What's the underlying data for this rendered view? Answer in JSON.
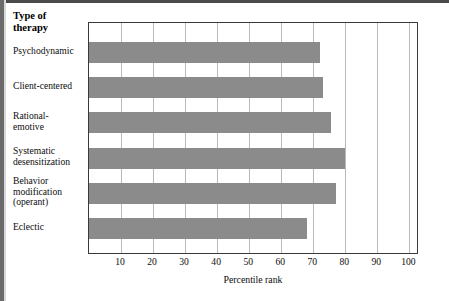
{
  "figure": {
    "category_header": "Type of\ntherapy",
    "category_header_line1": "Type of",
    "category_header_line2": "therapy",
    "bar_color": "#8b8b8b",
    "grid_color": "#b9b9b9",
    "frame_color": "#3a3a3a"
  },
  "chart_data": {
    "type": "bar",
    "orientation": "horizontal",
    "title": "",
    "xlabel": "Percentile rank",
    "ylabel": "Type of therapy",
    "categories": [
      "Psychodynamic",
      "Client-centered",
      "Rational-emotive",
      "Systematic desensitization",
      "Behavior modification (operant)",
      "Eclectic"
    ],
    "category_lines": [
      [
        "Psychodynamic"
      ],
      [
        "Client-centered"
      ],
      [
        "Rational-",
        "emotive"
      ],
      [
        "Systematic",
        "desensitization"
      ],
      [
        "Behavior",
        "modification",
        "(operant)"
      ],
      [
        "Eclectic"
      ]
    ],
    "values": [
      72,
      73,
      75.5,
      80,
      77,
      68
    ],
    "xlim": [
      0,
      103
    ],
    "xticks": [
      10,
      20,
      30,
      40,
      50,
      60,
      70,
      80,
      90,
      100
    ],
    "xticklabels": [
      "10",
      "20",
      "30",
      "40",
      "50",
      "60",
      "70",
      "80",
      "90",
      "100"
    ],
    "grid": true,
    "grid_axis": "x",
    "legend": false
  }
}
